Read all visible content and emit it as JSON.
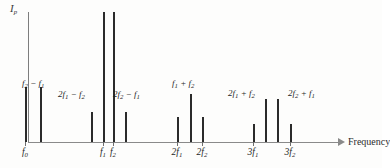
{
  "figure": {
    "type": "spectrum-line-plot",
    "y_axis_label": "Ip",
    "x_axis_label": "Frequency"
  },
  "chart_data": {
    "type": "bar",
    "title": "",
    "xlabel": "Frequency",
    "ylabel": "Ip",
    "grid": false,
    "legend": null,
    "categories": [
      "f0",
      "f2 - f1",
      "2f1 - f2",
      "f1",
      "f2",
      "2f2 - f1",
      "2f1",
      "f1 + f2",
      "2f2",
      "3f1",
      "2f1 + f2",
      "2f2 + f1",
      "3f2"
    ],
    "values": [
      55,
      55,
      30,
      130,
      130,
      30,
      25,
      48,
      25,
      18,
      43,
      43,
      18
    ],
    "xlim": [
      0,
      320
    ],
    "ylim": [
      0,
      135
    ]
  },
  "peaks": [
    {
      "id": "p-f0",
      "x": 25,
      "height": 55,
      "label": null
    },
    {
      "id": "p-f2-f1",
      "x": 40,
      "height": 55,
      "label": "f2-f1"
    },
    {
      "id": "p-2f1-f2",
      "x": 91,
      "height": 30,
      "label": "2f1-f2"
    },
    {
      "id": "p-f1",
      "x": 103,
      "height": 130,
      "label": null
    },
    {
      "id": "p-f2",
      "x": 113,
      "height": 130,
      "label": null
    },
    {
      "id": "p-2f2-f1",
      "x": 125,
      "height": 30,
      "label": "2f2-f1"
    },
    {
      "id": "p-2f1",
      "x": 177,
      "height": 25,
      "label": null
    },
    {
      "id": "p-f1+f2",
      "x": 190,
      "height": 48,
      "label": "f1+f2"
    },
    {
      "id": "p-2f2",
      "x": 202,
      "height": 25,
      "label": null
    },
    {
      "id": "p-3f1",
      "x": 253,
      "height": 18,
      "label": null
    },
    {
      "id": "p-2f1+f2",
      "x": 265,
      "height": 43,
      "label": "2f1+f2"
    },
    {
      "id": "p-2f2+f1",
      "x": 277,
      "height": 43,
      "label": "2f2+f1"
    },
    {
      "id": "p-3f2",
      "x": 290,
      "height": 18,
      "label": null
    }
  ],
  "ticks": [
    {
      "id": "t-f0",
      "x": 25,
      "base": "f",
      "sub": "0",
      "pre": ""
    },
    {
      "id": "t-f1",
      "x": 103,
      "base": "f",
      "sub": "1",
      "pre": ""
    },
    {
      "id": "t-f2",
      "x": 113,
      "base": "f",
      "sub": "2",
      "pre": ""
    },
    {
      "id": "t-2f1",
      "x": 177,
      "base": "f",
      "sub": "1",
      "pre": "2"
    },
    {
      "id": "t-2f2",
      "x": 202,
      "base": "f",
      "sub": "2",
      "pre": "2"
    },
    {
      "id": "t-3f1",
      "x": 253,
      "base": "f",
      "sub": "1",
      "pre": "3"
    },
    {
      "id": "t-3f2",
      "x": 290,
      "base": "f",
      "sub": "2",
      "pre": "3"
    }
  ],
  "annotations": [
    {
      "id": "a-f2-f1",
      "x": 22,
      "y": 78,
      "pre": "",
      "b1": "f",
      "s1": "2",
      "op": " − ",
      "pre2": "",
      "b2": "f",
      "s2": "1"
    },
    {
      "id": "a-2f1-f2",
      "x": 58,
      "y": 89,
      "pre": "2",
      "b1": "f",
      "s1": "1",
      "op": " − ",
      "pre2": "",
      "b2": "f",
      "s2": "2"
    },
    {
      "id": "a-2f2-f1",
      "x": 113,
      "y": 89,
      "pre": "2",
      "b1": "f",
      "s1": "2",
      "op": " − ",
      "pre2": "",
      "b2": "f",
      "s2": "1"
    },
    {
      "id": "a-f1+f2",
      "x": 172,
      "y": 78,
      "pre": "",
      "b1": "f",
      "s1": "1",
      "op": " + ",
      "pre2": "",
      "b2": "f",
      "s2": "2"
    },
    {
      "id": "a-2f1+f2",
      "x": 228,
      "y": 88,
      "pre": "2",
      "b1": "f",
      "s1": "1",
      "op": " + ",
      "pre2": "",
      "b2": "f",
      "s2": "2"
    },
    {
      "id": "a-2f2+f1",
      "x": 288,
      "y": 88,
      "pre": "2",
      "b1": "f",
      "s1": "2",
      "op": " + ",
      "pre2": "",
      "b2": "f",
      "s2": "1"
    }
  ],
  "labels": {
    "y_axis_base": "I",
    "y_axis_sub": "p",
    "x_axis": "Frequency"
  }
}
